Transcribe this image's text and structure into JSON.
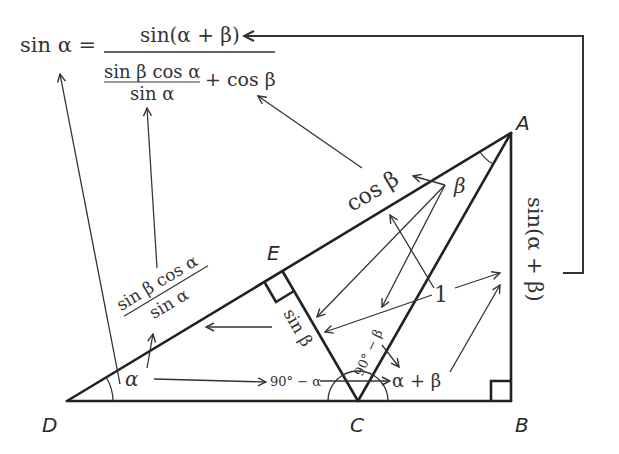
{
  "diagram": {
    "formula": {
      "lhs": "sin α =",
      "numerator": "sin(α + β)",
      "inner_numerator": "sin β cos α",
      "inner_denominator": "sin α",
      "plus_term": "+ cos β"
    },
    "vertices": {
      "A": {
        "label": "A",
        "x": 511,
        "y": 133
      },
      "B": {
        "label": "B",
        "x": 511,
        "y": 401
      },
      "C": {
        "label": "C",
        "x": 358,
        "y": 401
      },
      "D": {
        "label": "D",
        "x": 67,
        "y": 401
      },
      "E": {
        "label": "E",
        "x": 283,
        "y": 272
      }
    },
    "segment_labels": {
      "DE": "sin β cos α / sin α",
      "DE_num": "sin β cos α",
      "DE_den": "sin α",
      "EA": "cos β",
      "EC": "sin β",
      "AC": "1",
      "AB": "sin(α + β)"
    },
    "angle_labels": {
      "alpha": "α",
      "beta": "β",
      "ninety_minus_alpha": "90° − α",
      "ninety_minus_beta": "90° − β",
      "alpha_plus_beta": "α + β"
    },
    "right_angles": [
      "E",
      "B"
    ],
    "colors": {
      "line": "#222222",
      "text": "#333333",
      "background": "#ffffff"
    }
  }
}
